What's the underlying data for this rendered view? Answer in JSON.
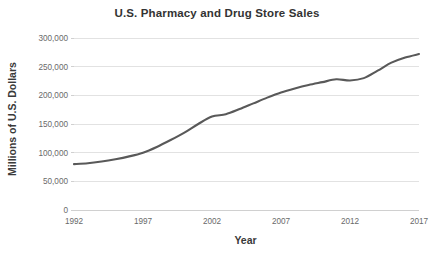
{
  "chart_data": {
    "type": "line",
    "title": "U.S. Pharmacy and Drug Store Sales",
    "xlabel": "Year",
    "ylabel": "Millions of U.S. Dollars",
    "xlim": [
      1992,
      2017
    ],
    "ylim": [
      0,
      300000
    ],
    "xticks": [
      "1992",
      "1997",
      "2002",
      "2007",
      "2012",
      "2017"
    ],
    "xtick_values": [
      1992,
      1997,
      2002,
      2007,
      2012,
      2017
    ],
    "yticks": [
      "0",
      "50,000",
      "100,000",
      "150,000",
      "200,000",
      "250,000",
      "300,000"
    ],
    "ytick_values": [
      0,
      50000,
      100000,
      150000,
      200000,
      250000,
      300000
    ],
    "grid": "horizontal",
    "legend": "none",
    "line_color": "#595959",
    "x": [
      1992,
      1993,
      1994,
      1995,
      1996,
      1997,
      1998,
      1999,
      2000,
      2001,
      2002,
      2003,
      2004,
      2005,
      2006,
      2007,
      2008,
      2009,
      2010,
      2011,
      2012,
      2013,
      2014,
      2015,
      2016,
      2017
    ],
    "series": [
      {
        "name": "U.S. Pharmacy and Drug Store Sales",
        "values": [
          80000,
          81500,
          84500,
          88500,
          93500,
          100000,
          110000,
          122000,
          135000,
          150000,
          163000,
          167000,
          176000,
          186000,
          196000,
          205000,
          212000,
          218000,
          223000,
          228000,
          226000,
          230000,
          243000,
          257000,
          266000,
          272000
        ]
      }
    ]
  }
}
